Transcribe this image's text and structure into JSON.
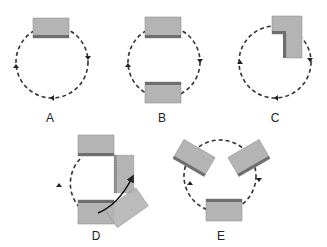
{
  "colors": {
    "block_fill": "#b4b4b4",
    "block_shade": "#6e6e6e",
    "path": "#222222",
    "background": "#ffffff"
  },
  "panels": [
    {
      "id": "A",
      "label": "A",
      "description": "Single block at top of circular dashed path, arrows clockwise"
    },
    {
      "id": "B",
      "label": "B",
      "description": "Two blocks, top and bottom of circular path"
    },
    {
      "id": "C",
      "label": "C",
      "description": "L-shaped block at upper-right of circular path"
    },
    {
      "id": "D",
      "label": "D",
      "description": "Blocks at top and bottom with one block rotating/moving along curved arrow to right position"
    },
    {
      "id": "E",
      "label": "E",
      "description": "Three blocks arranged around circular path at 120 degree intervals"
    }
  ]
}
